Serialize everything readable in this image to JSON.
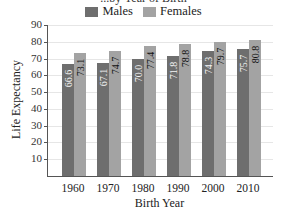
{
  "chart_data": {
    "type": "bar",
    "title": "...by Year of Birth",
    "xlabel": "Birth Year",
    "ylabel": "Life Expectancy",
    "categories": [
      "1960",
      "1970",
      "1980",
      "1990",
      "2000",
      "2010"
    ],
    "series": [
      {
        "name": "Males",
        "color": "#6e6e6e",
        "values": [
          66.6,
          67.1,
          70.0,
          71.8,
          74.3,
          75.7
        ],
        "labels": [
          "66.6",
          "67.1",
          "70.0",
          "71.8",
          "74.3",
          "75.7"
        ]
      },
      {
        "name": "Females",
        "color": "#a3a3a3",
        "values": [
          73.1,
          74.7,
          77.4,
          78.8,
          79.7,
          80.8
        ],
        "labels": [
          "73.1",
          "74.7",
          "77.4",
          "78.8",
          "79.7",
          "80.8"
        ]
      }
    ],
    "yticks": [
      "10",
      "20",
      "30",
      "40",
      "50",
      "60",
      "70",
      "80",
      "90"
    ],
    "ylim": [
      0,
      90
    ],
    "grid": true,
    "legend_position": "top"
  }
}
